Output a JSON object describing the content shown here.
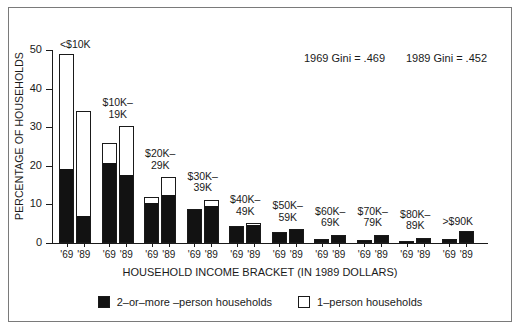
{
  "chart_data": {
    "type": "bar",
    "title": "",
    "subtitle": "",
    "xlabel": "HOUSEHOLD INCOME BRACKET (IN 1989 DOLLARS)",
    "ylabel": "PERCENTAGE OF HOUSEHOLDS",
    "ylim": [
      0,
      50
    ],
    "yticks": [
      0,
      10,
      20,
      30,
      40,
      50
    ],
    "ytick_labels": [
      "0",
      "10",
      "20",
      "30",
      "40",
      "50"
    ],
    "grid": false,
    "legend_position": "bottom-center",
    "stacked": true,
    "categories": [
      "<$10K",
      "$10K-\n19K",
      "$20K-\n29K",
      "$30K-\n39K",
      "$40K-\n49K",
      "$50K-\n59K",
      "$60K-\n69K",
      "$70K-\n79K",
      "$80K-\n89K",
      ">$90K"
    ],
    "year_labels": [
      "'69",
      "'89"
    ],
    "series": [
      {
        "name": "2-or-more-person households",
        "color": "#121212",
        "values_1969": [
          19.0,
          20.5,
          10.0,
          8.2,
          4.2,
          2.6,
          1.0,
          0.7,
          0.5,
          1.0
        ],
        "values_1989": [
          6.7,
          17.3,
          12.2,
          9.2,
          4.5,
          3.3,
          2.0,
          2.0,
          1.2,
          2.8
        ]
      },
      {
        "name": "1-person households",
        "color": "#ffffff",
        "values_1969": [
          30.0,
          5.5,
          2.0,
          0.6,
          0.3,
          0.2,
          0.1,
          0.1,
          0.1,
          0.1
        ],
        "values_1989": [
          27.5,
          13.0,
          4.8,
          2.0,
          0.6,
          0.3,
          0.2,
          0.2,
          0.1,
          0.2
        ]
      }
    ],
    "totals_1969": [
      49.0,
      26.0,
      12.0,
      8.8,
      4.5,
      2.8,
      1.1,
      0.8,
      0.6,
      1.1
    ],
    "totals_1989": [
      34.2,
      30.3,
      17.0,
      11.2,
      5.1,
      3.6,
      2.2,
      2.2,
      1.3,
      3.0
    ],
    "annotations": [
      {
        "id": "gini-1969",
        "text": "1969 Gini = .469"
      },
      {
        "id": "gini-1989",
        "text": "1989 Gini = .452"
      }
    ]
  },
  "axes": {
    "y_label": "PERCENTAGE OF HOUSEHOLDS",
    "x_label": "HOUSEHOLD INCOME BRACKET (IN 1989 DOLLARS)",
    "y_ticks": [
      "50",
      "40",
      "30",
      "20",
      "10",
      "0"
    ]
  },
  "groups": [
    {
      "title": "<$10K",
      "y1969_black": 19.0,
      "y1969_total": 49.0,
      "y1989_black": 6.7,
      "y1989_total": 34.2,
      "tick_left": "'69",
      "tick_right": "'89"
    },
    {
      "title": "$10K–\n19K",
      "y1969_black": 20.5,
      "y1969_total": 26.0,
      "y1989_black": 17.3,
      "y1989_total": 30.3,
      "tick_left": "'69",
      "tick_right": "'89"
    },
    {
      "title": "$20K–\n29K",
      "y1969_black": 10.0,
      "y1969_total": 12.0,
      "y1989_black": 12.2,
      "y1989_total": 17.0,
      "tick_left": "'69",
      "tick_right": "'89"
    },
    {
      "title": "$30K–\n39K",
      "y1969_black": 8.2,
      "y1969_total": 8.8,
      "y1989_black": 9.2,
      "y1989_total": 11.2,
      "tick_left": "'69",
      "tick_right": "'89"
    },
    {
      "title": "$40K–\n49K",
      "y1969_black": 4.2,
      "y1969_total": 4.5,
      "y1989_black": 4.5,
      "y1989_total": 5.1,
      "tick_left": "'69",
      "tick_right": "'89"
    },
    {
      "title": "$50K–\n59K",
      "y1969_black": 2.6,
      "y1969_total": 2.8,
      "y1989_black": 3.3,
      "y1989_total": 3.6,
      "tick_left": "'69",
      "tick_right": "'89"
    },
    {
      "title": "$60K–\n69K",
      "y1969_black": 1.0,
      "y1969_total": 1.1,
      "y1989_black": 2.0,
      "y1989_total": 2.2,
      "tick_left": "'69",
      "tick_right": "'89"
    },
    {
      "title": "$70K–\n79K",
      "y1969_black": 0.7,
      "y1969_total": 0.8,
      "y1989_black": 2.0,
      "y1989_total": 2.2,
      "tick_left": "'69",
      "tick_right": "'89"
    },
    {
      "title": "$80K–\n89K",
      "y1969_black": 0.5,
      "y1969_total": 0.6,
      "y1989_black": 1.2,
      "y1989_total": 1.3,
      "tick_left": "'69",
      "tick_right": "'89"
    },
    {
      "title": ">$90K",
      "y1969_black": 1.0,
      "y1969_total": 1.1,
      "y1989_black": 2.8,
      "y1989_total": 3.0,
      "tick_left": "'69",
      "tick_right": "'89"
    }
  ],
  "annotations": {
    "gini_1969": "1969 Gini = .469",
    "gini_1989": "1989 Gini = .452"
  },
  "legend": {
    "items": [
      {
        "label": "2–or–more –person households",
        "swatch": "filled-square-icon"
      },
      {
        "label": "1–person households",
        "swatch": "empty-square-icon"
      }
    ]
  }
}
